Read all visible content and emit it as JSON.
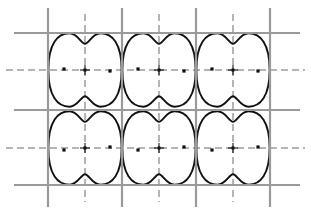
{
  "figure": {
    "width": 311,
    "height": 215,
    "background_color": "#ffffff"
  },
  "colors": {
    "lattice_line": "#9a9a9a",
    "symmetry_line": "#5a5a5a",
    "domain_outline": "#111111",
    "marker": "#111111",
    "background": "#ffffff"
  },
  "chart_data": {
    "type": "diagram",
    "xlabel": "",
    "ylabel": "",
    "xlim": [
      0,
      311
    ],
    "ylim": [
      0,
      215
    ],
    "grid": true,
    "legend": "none",
    "lattice": {
      "cell_width": 74,
      "cell_height": 75,
      "columns": 3,
      "rows": 2,
      "vertical_solid_x": [
        48,
        122,
        196,
        270
      ],
      "horizontal_solid_y": [
        33,
        110,
        185
      ],
      "vertical_dashed_x": [
        85,
        159,
        233
      ],
      "horizontal_dashed_y": [
        70,
        148
      ],
      "solid_line_extent_x": [
        14,
        300
      ],
      "solid_line_extent_y": [
        8,
        207
      ],
      "dashed_line_extent_x": [
        6,
        305
      ],
      "dashed_line_extent_y": [
        14,
        202
      ]
    },
    "domains": [
      {
        "id": "r1c1",
        "cx": 85,
        "cy": 70,
        "row": 1,
        "col": 1,
        "orientation": "normal"
      },
      {
        "id": "r1c2",
        "cx": 159,
        "cy": 70,
        "row": 1,
        "col": 2,
        "orientation": "normal"
      },
      {
        "id": "r1c3",
        "cx": 233,
        "cy": 70,
        "row": 1,
        "col": 3,
        "orientation": "normal"
      },
      {
        "id": "r2c1",
        "cx": 85,
        "cy": 148,
        "row": 2,
        "col": 1,
        "orientation": "mirrored"
      },
      {
        "id": "r2c2",
        "cx": 159,
        "cy": 148,
        "row": 2,
        "col": 2,
        "orientation": "mirrored"
      },
      {
        "id": "r2c3",
        "cx": 233,
        "cy": 148,
        "row": 2,
        "col": 3,
        "orientation": "mirrored"
      }
    ],
    "site_dots": [
      {
        "x": 64,
        "y": 69
      },
      {
        "x": 110,
        "y": 71
      },
      {
        "x": 138,
        "y": 69
      },
      {
        "x": 184,
        "y": 71
      },
      {
        "x": 212,
        "y": 69
      },
      {
        "x": 258,
        "y": 71
      },
      {
        "x": 64,
        "y": 150
      },
      {
        "x": 110,
        "y": 147
      },
      {
        "x": 138,
        "y": 150
      },
      {
        "x": 184,
        "y": 147
      },
      {
        "x": 212,
        "y": 150
      },
      {
        "x": 258,
        "y": 147
      }
    ],
    "cross_markers": [
      {
        "x": 85,
        "y": 70
      },
      {
        "x": 159,
        "y": 70
      },
      {
        "x": 233,
        "y": 70
      },
      {
        "x": 85,
        "y": 148
      },
      {
        "x": 159,
        "y": 148
      },
      {
        "x": 233,
        "y": 148
      }
    ]
  }
}
